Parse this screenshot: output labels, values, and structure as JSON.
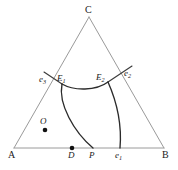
{
  "figure": {
    "name": "ternary-phase-diagram",
    "type": "ternary-composition-diagram",
    "background_color": "#ffffff",
    "edge_color": "#9a9a9a",
    "curve_color": "#2b2b2b",
    "dot_color": "#111111"
  },
  "vertices": {
    "a": {
      "label": "A",
      "x": 14,
      "y": 148,
      "text_x": 8,
      "text_y": 158
    },
    "b": {
      "label": "B",
      "x": 164,
      "y": 148,
      "text_x": 163,
      "text_y": 158
    },
    "c": {
      "label": "C",
      "x": 89,
      "y": 17,
      "text_x": 86,
      "text_y": 12
    }
  },
  "points": [
    {
      "id": "E1",
      "label": "E",
      "subscript": "1",
      "x": 62,
      "y": 84,
      "text_x": 58,
      "text_y": 80,
      "dot": false
    },
    {
      "id": "E2",
      "label": "E",
      "subscript": "2",
      "x": 108,
      "y": 82,
      "text_x": 98,
      "text_y": 79,
      "dot": false
    },
    {
      "id": "e1",
      "label": "e",
      "subscript": "1",
      "x": 120,
      "y": 148,
      "text_x": 116,
      "text_y": 158,
      "dot": false
    },
    {
      "id": "e2",
      "label": "e",
      "subscript": "2",
      "x": 126,
      "y": 72,
      "text_x": 124,
      "text_y": 76,
      "dot": false
    },
    {
      "id": "e3",
      "label": "e",
      "subscript": "3",
      "x": 50,
      "y": 79,
      "text_x": 40,
      "text_y": 82,
      "dot": false
    },
    {
      "id": "O",
      "label": "O",
      "subscript": "",
      "x": 45,
      "y": 125,
      "text_x": 41,
      "text_y": 121,
      "dot": true
    },
    {
      "id": "D",
      "label": "D",
      "subscript": "",
      "x": 72,
      "y": 148,
      "text_x": 68,
      "text_y": 158,
      "dot": true
    },
    {
      "id": "P",
      "label": "P",
      "subscript": "",
      "x": 93,
      "y": 148,
      "text_x": 89,
      "text_y": 158,
      "dot": false
    }
  ],
  "curves": [
    {
      "name": "e3-E1-tie-line",
      "path": "M 44 72 L 62 84",
      "kind": "tie-line"
    },
    {
      "name": "e2-E2-tie-line",
      "path": "M 132 66 L 108 82",
      "kind": "tie-line"
    },
    {
      "name": "E1-E2-boundary",
      "path": "M 62 84 C 74 91, 96 91, 108 82",
      "kind": "boundary"
    },
    {
      "name": "E1-to-P-boundary",
      "path": "M 62 84 C 58 104, 74 132, 93 148",
      "kind": "boundary"
    },
    {
      "name": "E2-to-e1-boundary",
      "path": "M 108 82 C 116 100, 122 124, 120 148",
      "kind": "boundary"
    }
  ],
  "labels": {
    "figure_caption": ""
  }
}
